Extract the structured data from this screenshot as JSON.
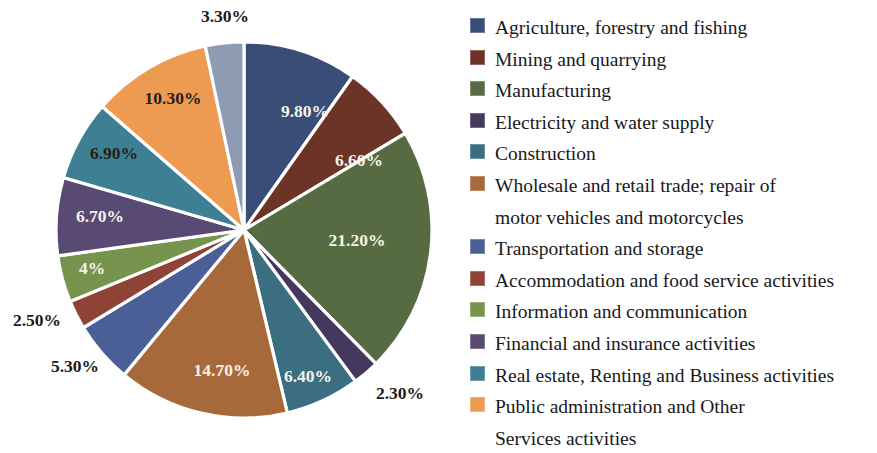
{
  "chart_data": {
    "type": "pie",
    "title": "",
    "subtitle": "",
    "xlabel": "",
    "ylabel": "",
    "legend_position": "right",
    "grid": false,
    "start_angle_deg": 0,
    "direction": "clockwise",
    "value_unit": "percent",
    "categories": [
      "Agriculture, forestry and fishing",
      "Mining and quarrying",
      "Manufacturing",
      "Electricity and water supply",
      "Construction",
      "Wholesale and retail trade; repair of motor vehicles and motorcycles",
      "Transportation and storage",
      "Accommodation and food service activities",
      "Information and communication",
      "Financial and insurance activities",
      "Real estate, Renting and Business activities",
      "Public administration and Other Services activities",
      "Taxes less subsidies"
    ],
    "values": [
      9.8,
      6.6,
      21.2,
      2.3,
      6.4,
      14.7,
      5.3,
      2.5,
      4.0,
      6.7,
      6.9,
      10.3,
      3.3
    ],
    "labels": [
      "9.80%",
      "6.60%",
      "21.20%",
      "2.30%",
      "6.40%",
      "14.70%",
      "5.30%",
      "2.50%",
      "4%",
      "6.70%",
      "6.90%",
      "10.30%",
      "3.30%"
    ],
    "colors": [
      "#3a4d77",
      "#6c3427",
      "#566b42",
      "#44385f",
      "#3b6e80",
      "#a8693a",
      "#4a5f96",
      "#8f4236",
      "#76944d",
      "#584a72",
      "#3f7f93",
      "#ee9b52",
      "#8d9bb3"
    ],
    "label_placement": [
      "inside",
      "inside",
      "inside",
      "outside",
      "inside",
      "inside",
      "outside",
      "outside",
      "inside",
      "inside",
      "inside",
      "inside",
      "outside"
    ]
  },
  "pie": {
    "slices": [
      {
        "label": "9.80%",
        "value": 9.8,
        "color": "#3a4d77",
        "category": "Agriculture, forestry and fishing",
        "label_x": 305,
        "label_y": 113,
        "label_style": "inside"
      },
      {
        "label": "6.60%",
        "value": 6.6,
        "color": "#6c3427",
        "category": "Mining and quarrying",
        "label_x": 359,
        "label_y": 162,
        "label_style": "inside"
      },
      {
        "label": "21.20%",
        "value": 21.2,
        "color": "#566b42",
        "category": "Manufacturing",
        "label_x": 357,
        "label_y": 242,
        "label_style": "inside"
      },
      {
        "label": "2.30%",
        "value": 2.3,
        "color": "#44385f",
        "category": "Electricity and water supply",
        "label_x": 400,
        "label_y": 395,
        "label_style": "outside"
      },
      {
        "label": "6.40%",
        "value": 6.4,
        "color": "#3b6e80",
        "category": "Construction",
        "label_x": 308,
        "label_y": 378,
        "label_style": "inside"
      },
      {
        "label": "14.70%",
        "value": 14.7,
        "color": "#a8693a",
        "category": "Wholesale and retail trade; repair of motor vehicles and motorcycles",
        "label_x": 222,
        "label_y": 372,
        "label_style": "inside"
      },
      {
        "label": "5.30%",
        "value": 5.3,
        "color": "#4a5f96",
        "category": "Transportation and storage",
        "label_x": 75,
        "label_y": 368,
        "label_style": "outside"
      },
      {
        "label": "2.50%",
        "value": 2.5,
        "color": "#8f4236",
        "category": "Accommodation and food service activities",
        "label_x": 37,
        "label_y": 322,
        "label_style": "outside"
      },
      {
        "label": "4%",
        "value": 4.0,
        "color": "#76944d",
        "category": "Information and communication",
        "label_x": 92,
        "label_y": 270,
        "label_style": "inside"
      },
      {
        "label": "6.70%",
        "value": 6.7,
        "color": "#584a72",
        "category": "Financial and insurance activities",
        "label_x": 100,
        "label_y": 218,
        "label_style": "inside"
      },
      {
        "label": "6.90%",
        "value": 6.9,
        "color": "#3f7f93",
        "category": "Real estate, Renting and Business activities",
        "label_x": 114,
        "label_y": 155,
        "label_style": "dark"
      },
      {
        "label": "10.30%",
        "value": 10.3,
        "color": "#ee9b52",
        "category": "Public administration and Other Services activities",
        "label_x": 173,
        "label_y": 100,
        "label_style": "dark"
      },
      {
        "label": "3.30%",
        "value": 3.3,
        "color": "#8d9bb3",
        "category": "",
        "label_x": 225,
        "label_y": 18,
        "label_style": "outside"
      }
    ],
    "center_x": 244,
    "center_y": 230,
    "radius": 188
  },
  "legend": {
    "items": [
      {
        "label": "Agriculture, forestry and fishing",
        "color": "#3a4d77",
        "continuation": ""
      },
      {
        "label": "Mining and quarrying",
        "color": "#6c3427",
        "continuation": ""
      },
      {
        "label": "Manufacturing",
        "color": "#566b42",
        "continuation": ""
      },
      {
        "label": "Electricity and water supply",
        "color": "#44385f",
        "continuation": ""
      },
      {
        "label": "Construction",
        "color": "#3b6e80",
        "continuation": ""
      },
      {
        "label": "Wholesale and retail trade; repair of",
        "color": "#a8693a",
        "continuation": "motor vehicles and motorcycles"
      },
      {
        "label": "Transportation and storage",
        "color": "#4a5f96",
        "continuation": ""
      },
      {
        "label": "Accommodation and food service activities",
        "color": "#8f4236",
        "continuation": ""
      },
      {
        "label": "Information and communication",
        "color": "#76944d",
        "continuation": ""
      },
      {
        "label": "Financial and insurance activities",
        "color": "#584a72",
        "continuation": ""
      },
      {
        "label": "Real estate, Renting and Business activities",
        "color": "#3f7f93",
        "continuation": ""
      },
      {
        "label": "Public administration and Other",
        "color": "#ee9b52",
        "continuation": "Services activities"
      }
    ]
  }
}
